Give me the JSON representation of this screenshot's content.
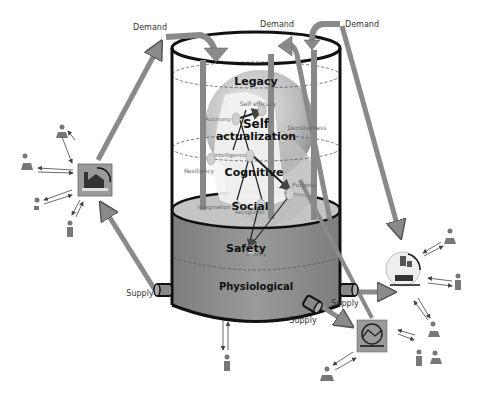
{
  "diagram": {
    "flow_labels": {
      "demand_left": "Demand",
      "demand_center": "Demand",
      "demand_right": "Demand",
      "supply_left": "Supply",
      "supply_right": "Supply",
      "supply_bottom": "Supply"
    },
    "levels": {
      "legacy": "Legacy",
      "self_actualization_1": "Self",
      "self_actualization_2": "actualization",
      "cognitive": "Cognitive",
      "social": "Social",
      "safety": "Safety",
      "physiological": "Physiological"
    },
    "attributes": {
      "self_efficacy": "Self efficacy",
      "autonomy": "Autonomy",
      "decisiveness": "Decisiveness",
      "intelligence": "Intelligence",
      "resiliency": "Resiliency",
      "purpose": "Purpose",
      "imagination": "Imagination",
      "recognition": "Recognition",
      "security": "Security"
    },
    "colors": {
      "tank_fill": "#8f8f8f",
      "tank_outline": "#111111",
      "arrow": "#8a8a8a",
      "node_bg": "#9a9a9a"
    }
  }
}
